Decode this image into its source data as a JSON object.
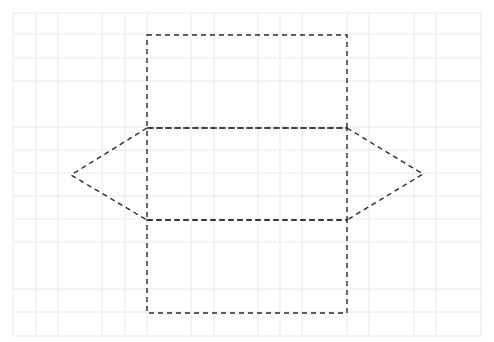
{
  "figure": {
    "width": 494,
    "height": 342,
    "colors": {
      "background": "#ffffff",
      "grid": "#e8e8e8",
      "outline": "#2b2b2b"
    },
    "grid": {
      "x_lines": [
        13,
        36,
        58,
        102,
        125,
        147,
        191,
        214,
        258,
        280,
        302,
        347,
        369,
        414,
        436,
        481
      ],
      "y_lines": [
        13,
        34,
        58,
        81,
        127,
        150,
        173,
        196,
        219,
        242,
        289,
        312,
        336
      ],
      "x_extent": [
        13,
        481
      ],
      "y_extent": [
        13,
        336
      ]
    },
    "shapes": {
      "top_rectangle": {
        "x1": 147,
        "y1": 35,
        "x2": 347,
        "y2": 128
      },
      "middle_rectangle": {
        "x1": 147,
        "y1": 128,
        "x2": 347,
        "y2": 220
      },
      "bottom_rectangle": {
        "x1": 147,
        "y1": 220,
        "x2": 347,
        "y2": 313
      },
      "left_triangle": [
        [
          147,
          128
        ],
        [
          71,
          175
        ],
        [
          147,
          220
        ]
      ],
      "right_triangle": [
        [
          347,
          128
        ],
        [
          423,
          174
        ],
        [
          347,
          220
        ]
      ]
    },
    "stroke": {
      "width": 1.4,
      "dash": "5,4"
    }
  }
}
